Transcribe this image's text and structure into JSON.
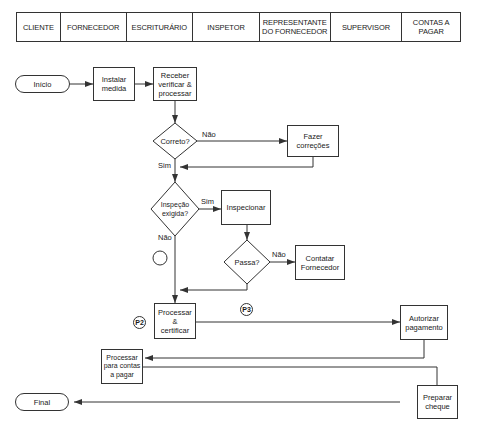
{
  "swimlanes": [
    {
      "label": "CLIENTE",
      "width": 44
    },
    {
      "label": "FORNECEDOR",
      "width": 66
    },
    {
      "label": "ESCRITURÁRIO",
      "width": 67
    },
    {
      "label": "INSPETOR",
      "width": 67
    },
    {
      "label": "REPRESENTANTE\nDO FORNECEDOR",
      "width": 71
    },
    {
      "label": "SUPERVISOR",
      "width": 72
    },
    {
      "label": "CONTAS A\nPAGAR",
      "width": 58
    }
  ],
  "nodes": {
    "inicio": "Início",
    "instalar": "Instalar\nmedida",
    "receber": "Receber\nverificar &\nprocessar",
    "correto": "Correto?",
    "fazer": "Fazer\ncorreções",
    "inspecao": "Inspeção\nexigida?",
    "inspecionar": "Inspecionar",
    "passa": "Passa?",
    "contatar": "Contatar\nFornecedor",
    "processar_cert": "Processar &\ncertificar",
    "autorizar": "Autorizar\npagamento",
    "processar_contas": "Processar\npara contas\na pagar",
    "preparar": "Preparar\ncheque",
    "final": "Final"
  },
  "edge_labels": {
    "correto_nao": "Não",
    "correto_sim": "Sim",
    "inspecao_sim": "Sim",
    "inspecao_nao": "Não",
    "passa_nao": "Não"
  },
  "markers": {
    "p2": "P2",
    "p3": "P3"
  },
  "colors": {
    "line": "#333333",
    "background": "#ffffff"
  }
}
